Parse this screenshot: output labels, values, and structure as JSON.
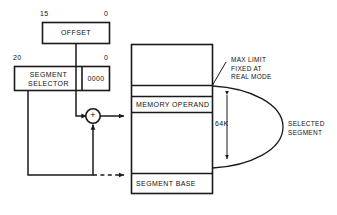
{
  "diagram": {
    "stroke_color": "#1a1a1a",
    "background": "#ffffff"
  },
  "offset_register": {
    "label": "OFFSET",
    "msb_label": "15",
    "lsb_label": "0"
  },
  "segment_register": {
    "selector_label": "SEGMENT\nSELECTOR",
    "shift_label": "0000",
    "msb_label": "20",
    "lsb_label": "0"
  },
  "adder": {
    "symbol": "+"
  },
  "memory": {
    "operand_label": "MEMORY OPERAND",
    "base_label": "SEGMENT BASE"
  },
  "annotations": {
    "max_limit": "MAX LIMIT\nFIXED AT\nREAL MODE",
    "size": "64K",
    "selected_segment": "SELECTED\nSEGMENT"
  }
}
